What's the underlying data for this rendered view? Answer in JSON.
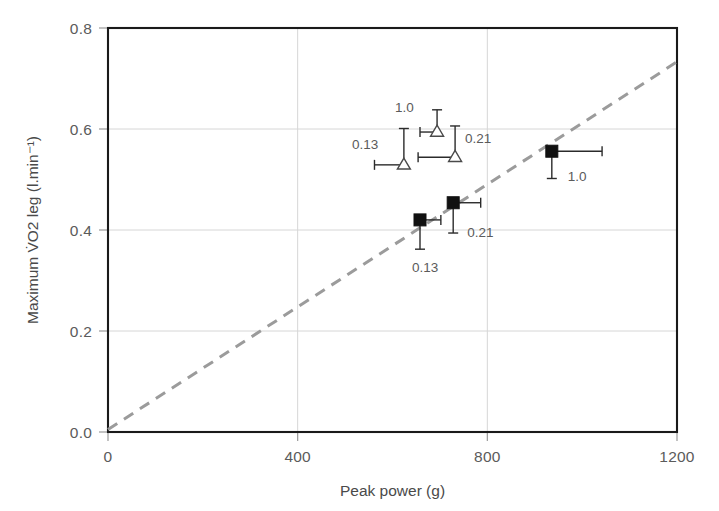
{
  "chart_data": {
    "type": "scatter",
    "title": "",
    "xlabel": "Peak power (g)",
    "ylabel": "Maximum V̇O2 leg (l.min⁻¹)",
    "xlim": [
      0,
      1200
    ],
    "ylim": [
      0.0,
      0.8
    ],
    "xticks": [
      0,
      400,
      800,
      1200
    ],
    "xtick_labels": [
      "0",
      "400",
      "800",
      "1200"
    ],
    "yticks": [
      0.0,
      0.2,
      0.4,
      0.6,
      0.8
    ],
    "ytick_labels": [
      "0.0",
      "0.2",
      "0.4",
      "0.6",
      "0.8"
    ],
    "grid": true,
    "legend": "none",
    "series": [
      {
        "name": "open-triangle",
        "marker": "open-triangle",
        "points": [
          {
            "label": "0.13",
            "x": 624,
            "y": 0.529,
            "xerr_low": 62,
            "xerr_high": 0,
            "yerr_low": 0,
            "yerr_high": 0.072,
            "label_dx": -52,
            "label_dy": -16
          },
          {
            "label": "1.0",
            "x": 694,
            "y": 0.594,
            "xerr_low": 36,
            "xerr_high": 0,
            "yerr_low": 0,
            "yerr_high": 0.044,
            "label_dx": -42,
            "label_dy": -20
          },
          {
            "label": "0.21",
            "x": 732,
            "y": 0.544,
            "xerr_low": 78,
            "xerr_high": 0,
            "yerr_low": 0,
            "yerr_high": 0.062,
            "label_dx": 10,
            "label_dy": -14
          }
        ]
      },
      {
        "name": "filled-square",
        "marker": "filled-square",
        "points": [
          {
            "label": "0.13",
            "x": 658,
            "y": 0.42,
            "xerr_low": 0,
            "xerr_high": 44,
            "yerr_low": 0.058,
            "yerr_high": 0,
            "label_dx": -8,
            "label_dy": 52
          },
          {
            "label": "0.21",
            "x": 728,
            "y": 0.454,
            "xerr_low": 0,
            "xerr_high": 58,
            "yerr_low": 0.06,
            "yerr_high": 0,
            "label_dx": 14,
            "label_dy": 34
          },
          {
            "label": "1.0",
            "x": 936,
            "y": 0.556,
            "xerr_low": 0,
            "xerr_high": 106,
            "yerr_low": 0.054,
            "yerr_high": 0,
            "label_dx": 16,
            "label_dy": 30
          }
        ]
      }
    ],
    "fit_line": {
      "name": "regression-line",
      "style": "dashed",
      "x_start": 0,
      "y_start": 0.005,
      "x_end": 1200,
      "y_end": 0.733
    }
  }
}
